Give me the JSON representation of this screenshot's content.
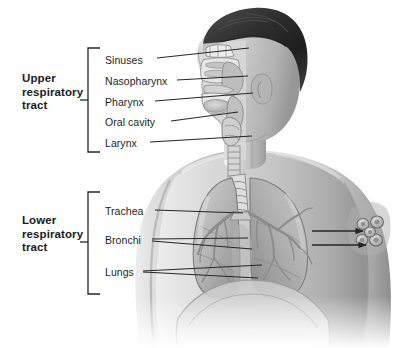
{
  "figure": {
    "background_color": "#ffffff",
    "line_color": "#262626",
    "text_color": "#1d1d1d"
  },
  "groups": [
    {
      "id": "upper",
      "label_line1": "Upper",
      "label_line2": "respiratory",
      "label_line3": "tract",
      "bracket": {
        "x": 88,
        "top": 48,
        "bottom": 152,
        "tick_x": 80,
        "tick_y": 100
      }
    },
    {
      "id": "lower",
      "label_line1": "Lower",
      "label_line2": "respiratory",
      "label_line3": "tract",
      "bracket": {
        "x": 88,
        "top": 192,
        "bottom": 294,
        "tick_x": 80,
        "tick_y": 242
      }
    }
  ],
  "labels": [
    {
      "name": "sinuses",
      "text": "Sinuses",
      "x": 105,
      "y": 62,
      "leader": {
        "x1": 157,
        "y1": 58,
        "x2": 249,
        "y2": 48
      }
    },
    {
      "name": "nasopharynx",
      "text": "Nasopharynx",
      "x": 105,
      "y": 84,
      "leader": {
        "x1": 177,
        "y1": 80,
        "x2": 248,
        "y2": 76
      }
    },
    {
      "name": "pharynx",
      "text": "Pharynx",
      "x": 105,
      "y": 105,
      "leader": {
        "x1": 155,
        "y1": 101,
        "x2": 253,
        "y2": 93
      }
    },
    {
      "name": "oral-cavity",
      "text": "Oral cavity",
      "x": 105,
      "y": 125,
      "leader": {
        "x1": 171,
        "y1": 121,
        "x2": 238,
        "y2": 112
      }
    },
    {
      "name": "larynx",
      "text": "Larynx",
      "x": 105,
      "y": 146,
      "leader": {
        "x1": 150,
        "y1": 142,
        "x2": 252,
        "y2": 136
      }
    },
    {
      "name": "trachea",
      "text": "Trachea",
      "x": 105,
      "y": 214,
      "leader": {
        "x1": 155,
        "y1": 210,
        "x2": 243,
        "y2": 213
      }
    },
    {
      "name": "bronchi",
      "text": "Bronchi",
      "x": 105,
      "y": 243,
      "leader": {
        "x1": 152,
        "y1": 239,
        "x2": 248,
        "y2": 238
      }
    },
    {
      "name": "bronchi-2",
      "text": "",
      "x": 0,
      "y": 0,
      "leader": {
        "x1": 152,
        "y1": 241,
        "x2": 252,
        "y2": 249
      }
    },
    {
      "name": "lungs",
      "text": "Lungs",
      "x": 105,
      "y": 275,
      "leader": {
        "x1": 143,
        "y1": 271,
        "x2": 262,
        "y2": 265
      }
    },
    {
      "name": "lungs-2",
      "text": "",
      "x": 0,
      "y": 0,
      "leader": {
        "x1": 143,
        "y1": 272,
        "x2": 258,
        "y2": 278
      }
    }
  ],
  "arrows": [
    {
      "name": "alveoli-arrow-upper",
      "x1": 312,
      "y1": 231,
      "x2": 365,
      "y2": 231
    },
    {
      "name": "alveoli-arrow-lower",
      "x1": 312,
      "y1": 245,
      "x2": 368,
      "y2": 245
    }
  ],
  "anatomy_parts": [
    "hair",
    "head-profile",
    "neck",
    "shoulder-left",
    "shoulder-right",
    "nasal-cavity",
    "sinus-cavity",
    "soft-palate",
    "tongue",
    "oral-cavity-space",
    "pharynx-passage",
    "larynx",
    "trachea-rings",
    "left-lung",
    "right-lung",
    "bronchial-tree",
    "diaphragm",
    "alveoli-cluster-inset"
  ]
}
